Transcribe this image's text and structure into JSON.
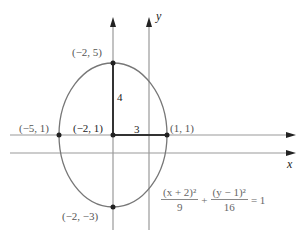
{
  "diagram": {
    "type": "ellipse-graph",
    "axes": {
      "x_label": "x",
      "y_label": "y"
    },
    "points": {
      "top": "(−2, 5)",
      "center": "(−2, 1)",
      "left": "(−5, 1)",
      "right": "(1, 1)",
      "bottom": "(−2, −3)"
    },
    "segment_labels": {
      "vertical": "4",
      "horizontal": "3"
    },
    "equation": {
      "term1_numerator": "(x + 2)²",
      "term1_denominator": "9",
      "plus": "+",
      "term2_numerator": "(y − 1)²",
      "term2_denominator": "16",
      "equals": "= 1"
    },
    "colors": {
      "curve": "#666666",
      "axis": "#888888",
      "dot": "#222222"
    }
  }
}
